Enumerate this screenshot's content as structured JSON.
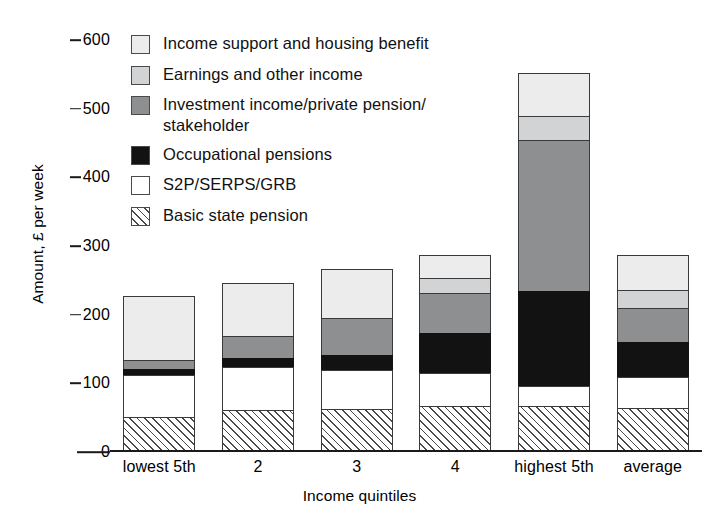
{
  "axes": {
    "ylabel": "Amount, £ per week",
    "xlabel": "Income quintiles",
    "yticks": [
      "0",
      "100",
      "200",
      "300",
      "400",
      "500",
      "600"
    ],
    "ymin": 0,
    "ymax": 600
  },
  "legend": {
    "items": [
      {
        "key": "income_support",
        "label": "Income support and housing benefit",
        "swatch": "legend-swatch-income-support",
        "color": "#ececed"
      },
      {
        "key": "earnings",
        "label": "Earnings and other income",
        "swatch": "legend-swatch-earnings",
        "color": "#d2d3d4"
      },
      {
        "key": "investment",
        "label": "Investment income/private pension/\nstakeholder",
        "swatch": "legend-swatch-investment",
        "color": "#8e8f90"
      },
      {
        "key": "occupational",
        "label": "Occupational pensions",
        "swatch": "legend-swatch-occupational",
        "color": "#121212"
      },
      {
        "key": "s2p",
        "label": "S2P/SERPS/GRB",
        "swatch": "legend-swatch-s2p",
        "color": "#ffffff"
      },
      {
        "key": "basic",
        "label": "Basic state pension",
        "swatch": "legend-swatch-basic",
        "color": "hatched"
      }
    ]
  },
  "chart_data": {
    "type": "bar",
    "subtype": "stacked",
    "title": "",
    "xlabel": "Income quintiles",
    "ylabel": "Amount, £ per week",
    "ylim": [
      0,
      600
    ],
    "ytick_values": [
      0,
      100,
      200,
      300,
      400,
      500,
      600
    ],
    "grid": false,
    "legend_position": "upper-left-inside",
    "categories": [
      "lowest 5th",
      "2",
      "3",
      "4",
      "highest 5th",
      "average"
    ],
    "stack_order_bottom_to_top": [
      "basic",
      "s2p",
      "occupational",
      "investment",
      "earnings",
      "income_support"
    ],
    "series": [
      {
        "name": "Basic state pension",
        "key": "basic",
        "values": [
          49,
          58,
          60,
          65,
          65,
          61
        ]
      },
      {
        "name": "S2P/SERPS/GRB",
        "key": "s2p",
        "values": [
          61,
          63,
          57,
          48,
          28,
          46
        ]
      },
      {
        "name": "Occupational pensions",
        "key": "occupational",
        "values": [
          8,
          14,
          22,
          58,
          139,
          50
        ]
      },
      {
        "name": "Investment income/private pension/stakeholder",
        "key": "investment",
        "values": [
          13,
          31,
          53,
          58,
          220,
          50
        ]
      },
      {
        "name": "Earnings and other income",
        "key": "earnings",
        "values": [
          0,
          0,
          0,
          22,
          35,
          26
        ]
      },
      {
        "name": "Income support and housing benefit",
        "key": "income_support",
        "values": [
          93,
          78,
          72,
          33,
          63,
          51
        ]
      }
    ],
    "totals": [
      224,
      244,
      264,
      284,
      550,
      284
    ]
  }
}
